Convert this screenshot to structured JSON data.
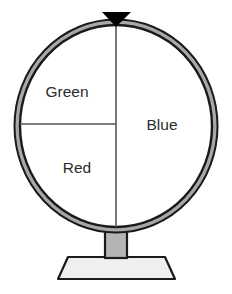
{
  "figure": {
    "name": "probability-spinner",
    "type": "spinner-wheel",
    "background_color": "#ffffff"
  },
  "wheel": {
    "ring_outer_color": "#1a1a1a",
    "ring_fill_color": "#a8a8a8",
    "ring_inner_color": "#1a1a1a",
    "face_color": "#ffffff",
    "divider_color": "#555555",
    "center_x": 116,
    "center_y": 126,
    "radius_x": 101,
    "radius_y": 106
  },
  "pointer": {
    "name": "spinner-pointer",
    "shape": "triangle-down",
    "color": "#000000",
    "position": "top-center"
  },
  "stand": {
    "post_color": "#b4b4b4",
    "post_outline": "#1a1a1a",
    "base_color": "#efefef",
    "base_outline": "#1a1a1a",
    "base_shape": "trapezoid"
  },
  "sectors": [
    {
      "label": "Green",
      "start_angle_deg": 270,
      "sweep_deg": 90,
      "fraction": "1/4",
      "label_x": 67,
      "label_y": 93
    },
    {
      "label": "Blue",
      "start_angle_deg": 0,
      "sweep_deg": 180,
      "fraction": "1/2",
      "label_x": 162,
      "label_y": 126
    },
    {
      "label": "Red",
      "start_angle_deg": 180,
      "sweep_deg": 90,
      "fraction": "1/4",
      "label_x": 77,
      "label_y": 168
    }
  ]
}
